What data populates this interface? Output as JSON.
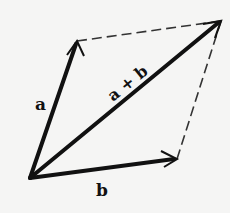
{
  "diagram": {
    "points": {
      "origin": [
        30,
        178
      ],
      "a_tip": [
        77,
        41
      ],
      "b_tip": [
        177,
        159
      ],
      "sum_tip": [
        221,
        21
      ]
    },
    "vectors": [
      {
        "id": "a",
        "label": "a",
        "from": "origin",
        "to": "a_tip",
        "style": "solid"
      },
      {
        "id": "b",
        "label": "b",
        "from": "origin",
        "to": "b_tip",
        "style": "solid"
      },
      {
        "id": "sum",
        "label": "a + b",
        "from": "origin",
        "to": "sum_tip",
        "style": "solid"
      }
    ],
    "dashed_edges": [
      {
        "from": "a_tip",
        "to": "sum_tip"
      },
      {
        "from": "b_tip",
        "to": "sum_tip"
      }
    ],
    "labels": {
      "a": "a",
      "b": "b",
      "sum": "a + b"
    },
    "colors": {
      "vector": "#111111",
      "dashed": "#333333",
      "background": "#f5f5f4"
    }
  }
}
